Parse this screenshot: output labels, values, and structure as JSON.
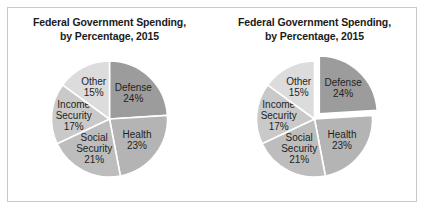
{
  "figure": {
    "border_color": "#c9c9c9",
    "background": "#ffffff"
  },
  "panels": [
    {
      "name": "pie-standard",
      "title_line1": "Federal Government Spending,",
      "title_line2": "by Percentage, 2015",
      "exploded_slice": null
    },
    {
      "name": "pie-exploded",
      "title_line1": "Federal Government Spending,",
      "title_line2": "by Percentage, 2015",
      "exploded_slice": "Defense"
    }
  ],
  "chart_data": {
    "type": "pie",
    "title": "Federal Government Spending, by Percentage, 2015",
    "categories": [
      "Defense",
      "Health",
      "Social Security",
      "Income Security",
      "Other"
    ],
    "values": [
      24,
      23,
      21,
      17,
      15
    ],
    "unit": "%",
    "labels": [
      "Defense 24%",
      "Health 23%",
      "Social Security 21%",
      "Income Security 17%",
      "Other 15%"
    ],
    "slice_label_lines": [
      [
        "Defense",
        "24%"
      ],
      [
        "Health",
        "23%"
      ],
      [
        "Social",
        "Security",
        "21%"
      ],
      [
        "Income",
        "Security",
        "17%"
      ],
      [
        "Other",
        "15%"
      ]
    ],
    "colors": [
      "#9c9c9c",
      "#b4b4b4",
      "#bdbdbd",
      "#c9c9c9",
      "#dcdcdc"
    ],
    "start_angle_deg": 0,
    "direction": "clockwise",
    "legend": "none",
    "grid": false,
    "variants": [
      "standard",
      "exploded-defense"
    ]
  }
}
